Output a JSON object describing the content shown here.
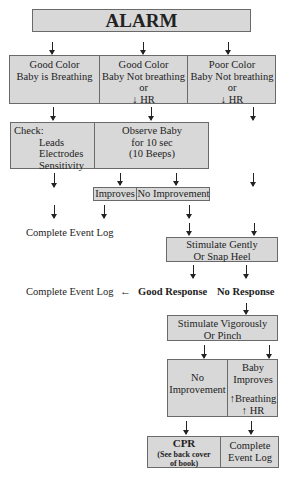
{
  "title": "ALARM",
  "row1": [
    {
      "lines": [
        "Good Color",
        "Baby is Breathing"
      ]
    },
    {
      "lines": [
        "Good Color",
        "Baby Not breathing",
        "or",
        "↓ HR"
      ]
    },
    {
      "lines": [
        "Poor Color",
        "Baby Not breathing",
        "or",
        "↓ HR"
      ]
    }
  ],
  "check": {
    "heading": "Check:",
    "items": [
      "Leads",
      "Electrodes",
      "Sensitivity"
    ]
  },
  "observe": {
    "lines": [
      "Observe Baby",
      "for 10 sec",
      "(10 Beeps)"
    ]
  },
  "outcome1": {
    "improves": "Improves",
    "no_improvement": "No Improvement"
  },
  "complete_log_1": "Complete Event Log",
  "stimulate_gently": {
    "lines": [
      "Stimulate Gently",
      "Or Snap Heel"
    ]
  },
  "complete_log_2": "Complete Event Log",
  "left_arrow": "←",
  "good_response": "Good Response",
  "no_response": "No Response",
  "stimulate_vigorously": {
    "lines": [
      "Stimulate Vigorously",
      "Or Pinch"
    ]
  },
  "outcome2": {
    "no_improvement": [
      "No",
      "Improvement"
    ],
    "baby_improves": [
      "Baby",
      "Improves",
      "",
      "↑Breathing",
      "↑ HR"
    ]
  },
  "final": {
    "cpr": {
      "title": "CPR",
      "note": [
        "(See back cover",
        "of book)"
      ]
    },
    "complete": [
      "Complete",
      "Event Log"
    ]
  },
  "colors": {
    "box_fill": "#d8d8d8",
    "box_border": "#6a6a6a",
    "text": "#222222"
  }
}
